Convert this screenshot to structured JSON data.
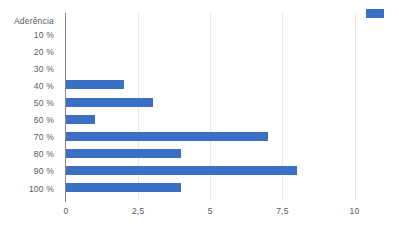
{
  "chart_data": {
    "type": "bar",
    "orientation": "horizontal",
    "title": "",
    "series_name": "Aderência",
    "categories": [
      "10 %",
      "20 %",
      "30 %",
      "40 %",
      "50 %",
      "60 %",
      "70 %",
      "80 %",
      "90 %",
      "100 %"
    ],
    "values": [
      0,
      0,
      0,
      2,
      3,
      1,
      7,
      4,
      8,
      4
    ],
    "series": [
      {
        "name": "Aderência",
        "values": [
          0,
          0,
          0,
          2,
          3,
          1,
          7,
          4,
          8,
          4
        ],
        "color": "#3a6fc4"
      }
    ],
    "xlabel": "",
    "ylabel": "",
    "xlim": [
      0,
      10.9
    ],
    "xticks": [
      0,
      2.5,
      5,
      7.5,
      10
    ],
    "xtick_labels": [
      "0",
      "2,5",
      "5",
      "7,5",
      "10"
    ],
    "grid": "vertical",
    "legend_position": "top-right",
    "bar_color": "#3a6fc4",
    "axis_color": "#868686",
    "gridline_color": "#e8e8e8",
    "label_color": "#595959"
  },
  "axis": {
    "series_title": "Aderência"
  }
}
